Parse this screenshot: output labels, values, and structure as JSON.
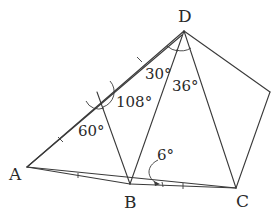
{
  "diagram": {
    "type": "geometry",
    "points": {
      "A": {
        "label": "A"
      },
      "B": {
        "label": "B"
      },
      "C": {
        "label": "C"
      },
      "D": {
        "label": "D"
      }
    },
    "angles": {
      "angle_108": "108°",
      "angle_60": "60°",
      "angle_30": "30°",
      "angle_36": "36°",
      "angle_6": "6°"
    },
    "colors": {
      "line": "#3a3a3a",
      "text": "#2a2a2a",
      "background": "#ffffff"
    }
  }
}
